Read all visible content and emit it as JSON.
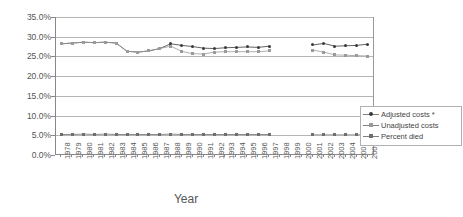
{
  "chart_data": {
    "type": "line",
    "title": "",
    "xlabel": "Year",
    "ylabel": "",
    "ylim": [
      0,
      35
    ],
    "ytick_labels": [
      "0.0%",
      "5.0%",
      "10.0%",
      "15.0%",
      "20.0%",
      "25.0%",
      "30.0%",
      "35.0%"
    ],
    "ytick_values": [
      0,
      5,
      10,
      15,
      20,
      25,
      30,
      35
    ],
    "grid": true,
    "legend_position": "right",
    "categories": [
      "1978",
      "1979",
      "1980",
      "1981",
      "1982",
      "1983",
      "1984",
      "1985",
      "1986",
      "1987",
      "1988",
      "1989",
      "1990",
      "1991",
      "1992",
      "1993",
      "1994",
      "1995",
      "1996",
      "1997",
      "1998",
      "1999",
      "2000",
      "2001",
      "2002",
      "2003",
      "2004",
      "2005",
      "2006"
    ],
    "series": [
      {
        "name": "Adjusted costs *",
        "color": "#3a3a3a",
        "marker": "circle",
        "values": [
          28.2,
          28.4,
          28.6,
          28.5,
          28.6,
          28.4,
          26.3,
          26.1,
          26.4,
          27.0,
          28.2,
          27.8,
          27.5,
          27.1,
          27.0,
          27.2,
          27.3,
          27.4,
          27.3,
          27.6,
          null,
          null,
          null,
          27.9,
          28.3,
          27.6,
          27.7,
          27.8,
          28.1
        ]
      },
      {
        "name": "Unadjusted costs",
        "color": "#9a9a9a",
        "marker": "square",
        "values": [
          28.2,
          28.4,
          28.6,
          28.5,
          28.6,
          28.4,
          26.3,
          26.1,
          26.4,
          27.0,
          27.6,
          26.3,
          25.7,
          25.6,
          26.1,
          26.2,
          26.2,
          26.2,
          26.2,
          26.4,
          null,
          null,
          null,
          26.6,
          26.1,
          25.4,
          25.3,
          25.2,
          25.1
        ]
      },
      {
        "name": "Percent died",
        "color": "#6f6f6f",
        "marker": "triangle",
        "values": [
          5.2,
          5.2,
          5.3,
          5.2,
          5.3,
          5.2,
          5.2,
          5.2,
          5.2,
          5.2,
          5.3,
          5.2,
          5.2,
          5.2,
          5.2,
          5.2,
          5.2,
          5.2,
          5.2,
          5.2,
          null,
          null,
          null,
          5.1,
          5.1,
          5.1,
          5.1,
          5.1,
          5.1
        ]
      }
    ]
  }
}
